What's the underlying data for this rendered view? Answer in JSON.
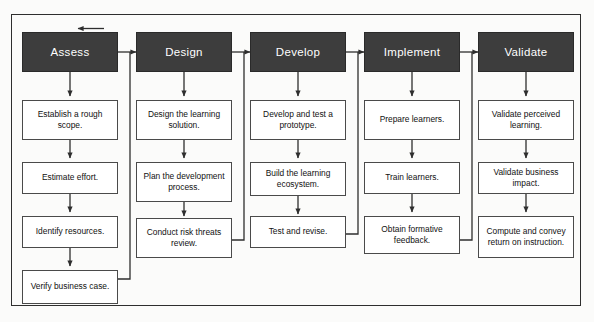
{
  "diagram": {
    "type": "flowchart",
    "header_fill": "#3d3d3d",
    "header_text_color": "#ffffff",
    "box_fill": "#ffffff",
    "line_color": "#2e2e2e",
    "feedback_arrow": {
      "name": "feedback-loop-arrow",
      "direction": "left",
      "target": "Assess"
    },
    "columns": [
      {
        "id": "assess",
        "header": "Assess",
        "steps": [
          "Establish a rough scope.",
          "Estimate effort.",
          "Identify resources.",
          "Verify business case."
        ]
      },
      {
        "id": "design",
        "header": "Design",
        "steps": [
          "Design the learning solution.",
          "Plan the development process.",
          "Conduct risk threats review."
        ]
      },
      {
        "id": "develop",
        "header": "Develop",
        "steps": [
          "Develop and test a prototype.",
          "Build the learning ecosystem.",
          "Test and revise."
        ]
      },
      {
        "id": "implement",
        "header": "Implement",
        "steps": [
          "Prepare learners.",
          "Train learners.",
          "Obtain formative feedback."
        ]
      },
      {
        "id": "validate",
        "header": "Validate",
        "steps": [
          "Validate perceived learning.",
          "Validate business impact.",
          "Compute and convey return on instruction."
        ]
      }
    ]
  }
}
